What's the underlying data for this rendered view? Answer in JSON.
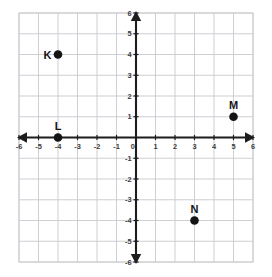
{
  "chart_data": {
    "type": "scatter",
    "title": "",
    "xlabel": "",
    "ylabel": "",
    "xlim": [
      -6,
      6
    ],
    "ylim": [
      -6,
      6
    ],
    "grid": true,
    "legend": "none",
    "x_ticks": [
      "-6",
      "-5",
      "-4",
      "-3",
      "-2",
      "-1",
      "0",
      "1",
      "2",
      "3",
      "4",
      "5",
      "6"
    ],
    "y_ticks": [
      "6",
      "5",
      "4",
      "3",
      "2",
      "1",
      "0",
      "-1",
      "-2",
      "-3",
      "-4",
      "-5",
      "-6"
    ],
    "x_tick_values": [
      -6,
      -5,
      -4,
      -3,
      -2,
      -1,
      0,
      1,
      2,
      3,
      4,
      5,
      6
    ],
    "y_tick_values": [
      6,
      5,
      4,
      3,
      2,
      1,
      0,
      -1,
      -2,
      -3,
      -4,
      -5,
      -6
    ],
    "points": [
      {
        "label": "K",
        "x": -4,
        "y": 4,
        "label_position": "left"
      },
      {
        "label": "L",
        "x": -4,
        "y": 0,
        "label_position": "above"
      },
      {
        "label": "M",
        "x": 5,
        "y": 1,
        "label_position": "above"
      },
      {
        "label": "N",
        "x": 3,
        "y": -4,
        "label_position": "above"
      }
    ],
    "colors": {
      "background": "#ffffff",
      "grid": "#c9c9cf",
      "axis": "#1d1d1d",
      "point": "#141414",
      "tick_label": "#3b3b3b"
    }
  }
}
